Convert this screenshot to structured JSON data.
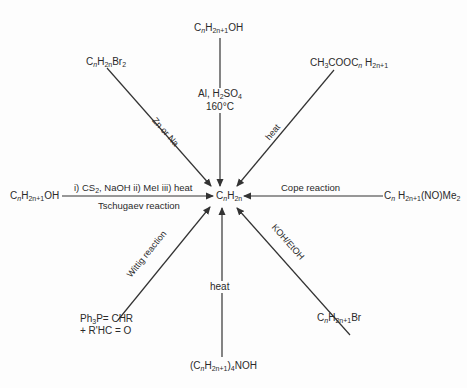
{
  "center": {
    "label": "CnH2n",
    "c": "C",
    "n1": "n",
    "h": "H",
    "n2": "2n"
  },
  "reactants": {
    "top": {
      "base": "C",
      "sub1": "n",
      "h": "H",
      "sub2": "2n+1",
      "tail": "OH"
    },
    "top_left": {
      "base": "C",
      "sub1": "n",
      "h": "H",
      "sub2": "2n",
      "tail": "Br",
      "sub3": "2"
    },
    "top_right": {
      "prefix": "CH",
      "sub0": "3",
      "mid": "COOC",
      "sub1": "n",
      "h": " H",
      "sub2": "2n+1"
    },
    "left": {
      "base": "C",
      "sub1": "n",
      "h": "H",
      "sub2": "2n+1",
      "tail": "OH"
    },
    "right": {
      "base": "C",
      "sub1": "n",
      "h": " H",
      "sub2": "2n+1",
      "tail": "(NO)Me",
      "sub3": "2"
    },
    "bottom_left_line1": {
      "a": "Ph",
      "sub": "3",
      "b": "P= CHR"
    },
    "bottom_left_line2": "+ R'HC = O",
    "bottom": {
      "open": "(C",
      "sub1": "n",
      "h": "H",
      "sub2": "2n+1",
      "close": ")",
      "sub3": "4",
      "tail": "NOH"
    },
    "bottom_right": {
      "base": "C",
      "sub1": "n",
      "h": "H",
      "sub2": "2n+1",
      "tail": "Br"
    }
  },
  "conditions": {
    "top_line1": {
      "a": "Al, H",
      "sub": "2",
      "b": "SO",
      "sub2": "4"
    },
    "top_line2": "160°C",
    "top_left": "Zn or Na",
    "top_right": "heat",
    "left_above": {
      "a": "i) CS",
      "sub": "2",
      "b": ", NaOH  ii) MeI  iii) heat"
    },
    "left_below": "Tschugaev reaction",
    "right_above": "Cope reaction",
    "bottom_left": "Wittig reaction",
    "bottom": "heat",
    "bottom_right": "KOH/EtOH"
  },
  "colors": {
    "line": "#333333",
    "text": "#2a2a2a",
    "background": "#fdfdfd"
  }
}
